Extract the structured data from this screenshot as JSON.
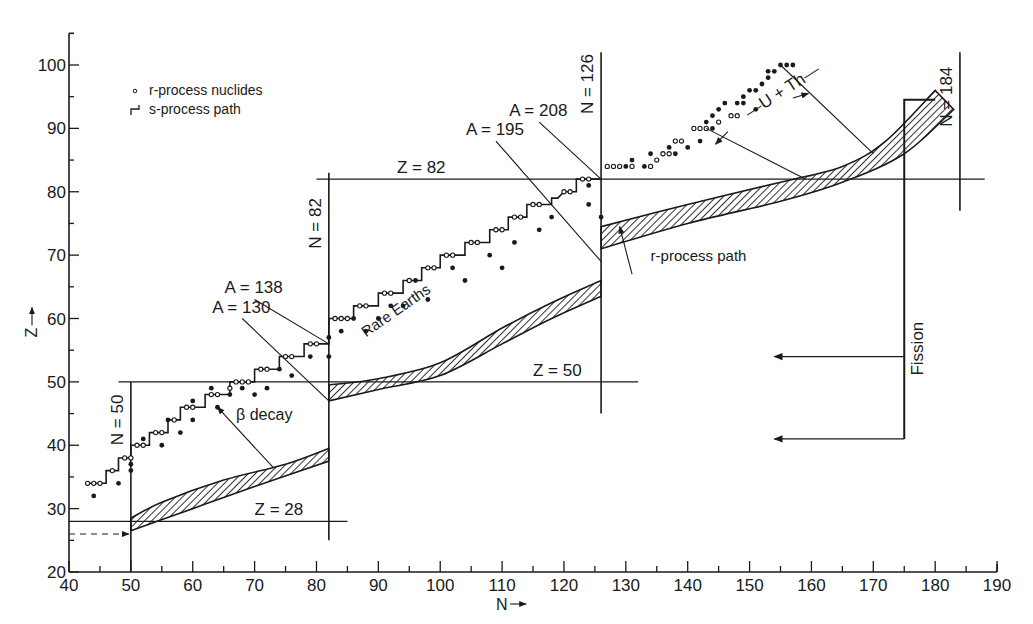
{
  "chart_data": {
    "type": "scatter",
    "title": "",
    "xlabel": "N",
    "ylabel": "Z",
    "xlim": [
      40,
      190
    ],
    "ylim": [
      20,
      105
    ],
    "grid": false,
    "legend_position": "upper-left",
    "x_ticks_major": [
      40,
      50,
      60,
      70,
      80,
      90,
      100,
      110,
      120,
      130,
      140,
      150,
      160,
      170,
      180,
      190
    ],
    "y_ticks_major": [
      20,
      30,
      40,
      50,
      60,
      70,
      80,
      90,
      100
    ],
    "legend": [
      {
        "symbol": "dot",
        "label": "r-process nuclides"
      },
      {
        "symbol": "step",
        "label": "s-process path"
      }
    ],
    "magic_lines": [
      {
        "label": "N = 50",
        "orientation": "vertical",
        "at": 50,
        "from": 20,
        "to": 50
      },
      {
        "label": "N = 82",
        "orientation": "vertical",
        "at": 82,
        "from": 25,
        "to": 83
      },
      {
        "label": "N = 126",
        "orientation": "vertical",
        "at": 126,
        "from": 45,
        "to": 102
      },
      {
        "label": "N = 184",
        "orientation": "vertical",
        "at": 184,
        "from": 77,
        "to": 102
      },
      {
        "label": "Z = 28",
        "orientation": "horizontal",
        "at": 28,
        "from": 40,
        "to": 85
      },
      {
        "label": "Z = 50",
        "orientation": "horizontal",
        "at": 50,
        "from": 48,
        "to": 132
      },
      {
        "label": "Z = 82",
        "orientation": "horizontal",
        "at": 82,
        "from": 80,
        "to": 188
      }
    ],
    "isobar_lines": [
      {
        "label": "A = 130",
        "from": [
          68,
          60
        ],
        "to": [
          82,
          47
        ]
      },
      {
        "label": "A = 138",
        "from": [
          70,
          63
        ],
        "to": [
          82,
          56
        ]
      },
      {
        "label": "A = 195",
        "from": [
          109,
          88
        ],
        "to": [
          126,
          69
        ]
      },
      {
        "label": "A = 208",
        "from": [
          116,
          91
        ],
        "to": [
          126,
          82
        ]
      }
    ],
    "s_process_path": [
      [
        43,
        34
      ],
      [
        46,
        34
      ],
      [
        46,
        36
      ],
      [
        48,
        36
      ],
      [
        48,
        38
      ],
      [
        50,
        38
      ],
      [
        50,
        40
      ],
      [
        53,
        40
      ],
      [
        53,
        42
      ],
      [
        56,
        42
      ],
      [
        56,
        44
      ],
      [
        58,
        44
      ],
      [
        58,
        46
      ],
      [
        62,
        46
      ],
      [
        62,
        48
      ],
      [
        66,
        48
      ],
      [
        66,
        50
      ],
      [
        70,
        50
      ],
      [
        70,
        52
      ],
      [
        74,
        52
      ],
      [
        74,
        54
      ],
      [
        78,
        54
      ],
      [
        78,
        56
      ],
      [
        82,
        56
      ],
      [
        82,
        60
      ],
      [
        86,
        60
      ],
      [
        86,
        62
      ],
      [
        90,
        62
      ],
      [
        90,
        64
      ],
      [
        94,
        64
      ],
      [
        94,
        66
      ],
      [
        97,
        66
      ],
      [
        97,
        68
      ],
      [
        100,
        68
      ],
      [
        100,
        70
      ],
      [
        104,
        70
      ],
      [
        104,
        72
      ],
      [
        108,
        72
      ],
      [
        108,
        74
      ],
      [
        111,
        74
      ],
      [
        111,
        76
      ],
      [
        114,
        76
      ],
      [
        114,
        78
      ],
      [
        118,
        78
      ],
      [
        118,
        79
      ],
      [
        119,
        79
      ],
      [
        120,
        80
      ],
      [
        122,
        80
      ],
      [
        122,
        82
      ],
      [
        126,
        82
      ]
    ],
    "r_process_nuclides_open": [
      [
        43,
        34
      ],
      [
        44,
        34
      ],
      [
        45,
        34
      ],
      [
        47,
        36
      ],
      [
        49,
        38
      ],
      [
        50,
        38
      ],
      [
        51,
        40
      ],
      [
        52,
        40
      ],
      [
        54,
        42
      ],
      [
        55,
        42
      ],
      [
        57,
        44
      ],
      [
        59,
        46
      ],
      [
        60,
        46
      ],
      [
        63,
        48
      ],
      [
        64,
        48
      ],
      [
        66,
        49
      ],
      [
        67,
        50
      ],
      [
        68,
        50
      ],
      [
        69,
        50
      ],
      [
        71,
        52
      ],
      [
        72,
        52
      ],
      [
        75,
        54
      ],
      [
        76,
        54
      ],
      [
        79,
        56
      ],
      [
        80,
        56
      ],
      [
        83,
        60
      ],
      [
        84,
        60
      ],
      [
        85,
        60
      ],
      [
        87,
        62
      ],
      [
        88,
        62
      ],
      [
        91,
        64
      ],
      [
        92,
        64
      ],
      [
        95,
        66
      ],
      [
        98,
        68
      ],
      [
        99,
        68
      ],
      [
        101,
        70
      ],
      [
        102,
        70
      ],
      [
        105,
        72
      ],
      [
        106,
        72
      ],
      [
        109,
        74
      ],
      [
        110,
        74
      ],
      [
        112,
        76
      ],
      [
        113,
        76
      ],
      [
        115,
        78
      ],
      [
        116,
        78
      ],
      [
        120,
        80
      ],
      [
        121,
        80
      ],
      [
        123,
        82
      ],
      [
        124,
        82
      ],
      [
        127,
        84
      ],
      [
        128,
        84
      ],
      [
        129,
        84
      ],
      [
        131,
        84
      ],
      [
        134,
        84
      ],
      [
        135,
        85
      ],
      [
        136,
        86
      ],
      [
        137,
        86
      ],
      [
        138,
        88
      ],
      [
        139,
        88
      ],
      [
        141,
        90
      ],
      [
        142,
        90
      ],
      [
        143,
        90
      ],
      [
        145,
        91
      ],
      [
        147,
        92
      ],
      [
        148,
        92
      ]
    ],
    "r_process_nuclides_filled": [
      [
        44,
        32
      ],
      [
        48,
        34
      ],
      [
        50,
        36
      ],
      [
        50,
        37
      ],
      [
        52,
        41
      ],
      [
        55,
        40
      ],
      [
        56,
        44
      ],
      [
        58,
        42
      ],
      [
        60,
        44
      ],
      [
        60,
        47
      ],
      [
        63,
        49
      ],
      [
        64,
        46
      ],
      [
        66,
        48
      ],
      [
        68,
        49
      ],
      [
        70,
        48
      ],
      [
        72,
        49
      ],
      [
        74,
        52
      ],
      [
        76,
        51
      ],
      [
        79,
        54
      ],
      [
        82,
        54
      ],
      [
        82,
        57
      ],
      [
        84,
        58
      ],
      [
        86,
        60
      ],
      [
        88,
        58
      ],
      [
        90,
        60
      ],
      [
        92,
        62
      ],
      [
        94,
        62
      ],
      [
        96,
        66
      ],
      [
        98,
        63
      ],
      [
        102,
        68
      ],
      [
        104,
        66
      ],
      [
        108,
        70
      ],
      [
        110,
        68
      ],
      [
        112,
        72
      ],
      [
        116,
        74
      ],
      [
        118,
        76
      ],
      [
        124,
        78
      ],
      [
        124,
        81
      ],
      [
        126,
        76
      ],
      [
        130,
        84
      ],
      [
        131,
        85
      ],
      [
        133,
        84
      ],
      [
        134,
        86
      ],
      [
        137,
        87
      ],
      [
        138,
        86
      ],
      [
        140,
        87
      ],
      [
        142,
        88
      ],
      [
        144,
        90
      ],
      [
        144,
        92
      ],
      [
        145,
        93
      ],
      [
        146,
        94
      ],
      [
        148,
        94
      ],
      [
        149,
        95
      ],
      [
        149,
        94
      ],
      [
        150,
        96
      ],
      [
        151,
        96
      ],
      [
        152,
        97
      ],
      [
        153,
        98
      ],
      [
        153,
        99
      ],
      [
        154,
        99
      ],
      [
        155,
        100
      ],
      [
        156,
        100
      ],
      [
        157,
        100
      ],
      [
        143,
        91
      ],
      [
        151,
        93
      ]
    ],
    "r_process_path_bands": [
      {
        "segment": "50-82",
        "lower": [
          [
            50,
            26.5
          ],
          [
            60,
            30
          ],
          [
            70,
            33.5
          ],
          [
            82,
            37.5
          ]
        ],
        "upper": [
          [
            50,
            28.5
          ],
          [
            55,
            31
          ],
          [
            65,
            34.5
          ],
          [
            75,
            37
          ],
          [
            82,
            39.5
          ]
        ]
      },
      {
        "segment": "82-126",
        "lower": [
          [
            82,
            47
          ],
          [
            90,
            48.8
          ],
          [
            100,
            51
          ],
          [
            110,
            56
          ],
          [
            118,
            60
          ],
          [
            126,
            63.5
          ]
        ],
        "upper": [
          [
            82,
            49.5
          ],
          [
            90,
            50.5
          ],
          [
            100,
            53
          ],
          [
            110,
            58.5
          ],
          [
            118,
            62.5
          ],
          [
            126,
            66
          ]
        ]
      },
      {
        "segment": "126-184",
        "lower": [
          [
            126,
            71
          ],
          [
            140,
            75
          ],
          [
            155,
            78.5
          ],
          [
            165,
            81.5
          ],
          [
            175,
            86
          ],
          [
            183,
            93
          ]
        ],
        "upper": [
          [
            126,
            74.5
          ],
          [
            140,
            78
          ],
          [
            155,
            81.5
          ],
          [
            165,
            84
          ],
          [
            172,
            88
          ],
          [
            180,
            96
          ]
        ]
      }
    ],
    "annotations": [
      {
        "text": "Rare Earths",
        "N": 88,
        "Z": 57,
        "rotate": -35
      },
      {
        "text": "β decay",
        "N": 67,
        "Z": 44
      },
      {
        "text": "r-process path",
        "N": 134,
        "Z": 69
      },
      {
        "text": "U + Th",
        "N": 150,
        "Z": 91.5,
        "rotate": -33
      },
      {
        "text": "Fission",
        "N": 178,
        "Z": 51,
        "rotate": -90
      }
    ],
    "fission_lines": {
      "vertical_at_N": 175,
      "from_Z": 41,
      "to_Z": 94.5,
      "top_bar_to_N": 180,
      "arrows": [
        {
          "Z": 54,
          "to_N": 154
        },
        {
          "Z": 41,
          "to_N": 154
        }
      ]
    },
    "beta_decay_arrow": {
      "from": [
        73,
        36.5
      ],
      "to": [
        64,
        46
      ]
    },
    "r_path_pointer": {
      "from": [
        131,
        67
      ],
      "to": [
        129,
        74.5
      ]
    },
    "u_th_bracket": {
      "tail_start": [
        143,
        90
      ],
      "head_end": [
        155,
        100
      ],
      "end_low": [
        159,
        82
      ],
      "end_high": [
        170,
        86
      ]
    },
    "dashed_input_arrow": {
      "Z": 26,
      "from_N": 40,
      "to_N": 50
    }
  }
}
